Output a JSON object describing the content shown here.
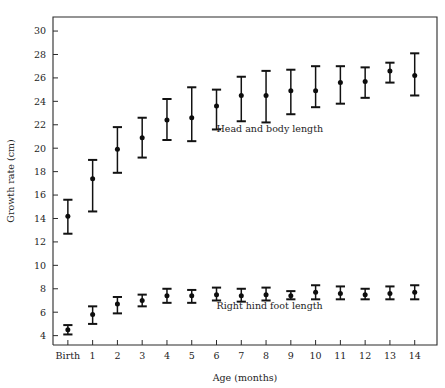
{
  "chart_data": {
    "type": "scatter",
    "title": "",
    "xlabel": "Age (months)",
    "ylabel": "Growth rate (cm)",
    "categories": [
      "Birth",
      "1",
      "2",
      "3",
      "4",
      "5",
      "6",
      "7",
      "8",
      "9",
      "10",
      "11",
      "12",
      "13",
      "14"
    ],
    "x": [
      0,
      1,
      2,
      3,
      4,
      5,
      6,
      7,
      8,
      9,
      10,
      11,
      12,
      13,
      14
    ],
    "xlim": [
      -0.6,
      14.9
    ],
    "ylim": [
      3.2,
      31.2
    ],
    "yticks": [
      4,
      6,
      8,
      10,
      12,
      14,
      16,
      18,
      20,
      22,
      24,
      26,
      28,
      30
    ],
    "grid": false,
    "legend_position": "inline-annotation",
    "error_bar_style": "mean with capped whiskers (range)",
    "series": [
      {
        "name": "Head and body length",
        "annotation": "Head and body length",
        "annotation_x": 6.0,
        "annotation_y": 21.4,
        "values": [
          14.2,
          17.4,
          19.9,
          20.9,
          22.4,
          22.6,
          23.6,
          24.5,
          24.5,
          24.9,
          24.9,
          25.6,
          25.7,
          26.6,
          26.2
        ],
        "err_low": [
          12.7,
          14.6,
          17.9,
          19.2,
          20.7,
          20.6,
          21.6,
          22.3,
          22.2,
          22.9,
          23.5,
          23.8,
          24.3,
          25.6,
          24.5
        ],
        "err_high": [
          15.6,
          19.0,
          21.8,
          22.6,
          24.2,
          25.2,
          25.0,
          26.1,
          26.6,
          26.7,
          27.0,
          27.0,
          26.9,
          27.3,
          28.1
        ]
      },
      {
        "name": "Right hind foot length",
        "annotation": "Right hind foot length",
        "annotation_x": 6.0,
        "annotation_y": 6.3,
        "values": [
          4.5,
          5.8,
          6.7,
          7.0,
          7.4,
          7.4,
          7.5,
          7.4,
          7.5,
          7.4,
          7.7,
          7.6,
          7.5,
          7.6,
          7.7
        ],
        "err_low": [
          4.1,
          5.0,
          5.9,
          6.5,
          6.8,
          6.8,
          7.0,
          6.9,
          7.0,
          7.1,
          7.1,
          7.1,
          7.1,
          7.1,
          7.1
        ],
        "err_high": [
          4.9,
          6.5,
          7.3,
          7.5,
          8.0,
          7.9,
          8.1,
          8.0,
          8.1,
          7.8,
          8.3,
          8.2,
          8.0,
          8.2,
          8.3
        ]
      }
    ]
  },
  "colors": {
    "marker": "#0d0d0d",
    "axis": "#2b2b2b",
    "text": "#242424",
    "background": "#ffffff"
  }
}
